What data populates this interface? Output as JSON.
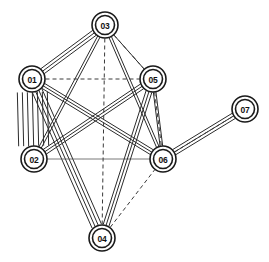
{
  "figure": {
    "type": "network-graph",
    "title": "",
    "background_color": "#ffffff",
    "node_fill_color": "#ffffff",
    "node_stroke_color": "#1a1a1a",
    "edge_color": "#2b2b2b",
    "width": 269,
    "height": 262
  },
  "nodes": [
    {
      "id": "01",
      "label": "01",
      "x": 32,
      "y": 79,
      "r_outer": 13,
      "r_inner": 9.5
    },
    {
      "id": "02",
      "label": "02",
      "x": 34,
      "y": 159,
      "r_outer": 13,
      "r_inner": 9.5
    },
    {
      "id": "03",
      "label": "03",
      "x": 105,
      "y": 25,
      "r_outer": 13,
      "r_inner": 9.5
    },
    {
      "id": "04",
      "label": "04",
      "x": 102,
      "y": 238,
      "r_outer": 13,
      "r_inner": 9.5
    },
    {
      "id": "05",
      "label": "05",
      "x": 153,
      "y": 79,
      "r_outer": 13,
      "r_inner": 9.5
    },
    {
      "id": "06",
      "label": "06",
      "x": 163,
      "y": 159,
      "r_outer": 13,
      "r_inner": 9.5
    },
    {
      "id": "07",
      "label": "07",
      "x": 245,
      "y": 109,
      "r_outer": 13,
      "r_inner": 9.5
    }
  ],
  "edges": [
    {
      "from": "01",
      "to": "02",
      "style": "solid",
      "multiplicity": 7,
      "spread": 5.0
    },
    {
      "from": "01",
      "to": "03",
      "style": "solid",
      "multiplicity": 3,
      "spread": 3.0
    },
    {
      "from": "01",
      "to": "04",
      "style": "solid",
      "multiplicity": 4,
      "spread": 3.4
    },
    {
      "from": "01",
      "to": "05",
      "style": "dashed",
      "multiplicity": 1,
      "spread": 0
    },
    {
      "from": "01",
      "to": "06",
      "style": "solid",
      "multiplicity": 3,
      "spread": 2.8
    },
    {
      "from": "02",
      "to": "03",
      "style": "solid",
      "multiplicity": 2,
      "spread": 2.6
    },
    {
      "from": "02",
      "to": "05",
      "style": "solid",
      "multiplicity": 3,
      "spread": 2.8
    },
    {
      "from": "02",
      "to": "06",
      "style": "thin",
      "multiplicity": 1,
      "spread": 0
    },
    {
      "from": "03",
      "to": "04",
      "style": "dashed",
      "multiplicity": 1,
      "spread": 0
    },
    {
      "from": "03",
      "to": "05",
      "style": "solid",
      "multiplicity": 1,
      "spread": 0
    },
    {
      "from": "03",
      "to": "05",
      "style": "dashed",
      "multiplicity": 1,
      "spread": 3.2
    },
    {
      "from": "03",
      "to": "06",
      "style": "solid",
      "multiplicity": 2,
      "spread": 2.6
    },
    {
      "from": "04",
      "to": "05",
      "style": "solid",
      "multiplicity": 3,
      "spread": 3.0
    },
    {
      "from": "04",
      "to": "06",
      "style": "dashed",
      "multiplicity": 1,
      "spread": 0
    },
    {
      "from": "05",
      "to": "06",
      "style": "solid",
      "multiplicity": 2,
      "spread": 2.6
    },
    {
      "from": "05",
      "to": "06",
      "style": "dashed",
      "multiplicity": 1,
      "spread": 4.0
    },
    {
      "from": "06",
      "to": "07",
      "style": "solid",
      "multiplicity": 3,
      "spread": 3.0
    },
    {
      "from": "06",
      "to": "07",
      "style": "dashed",
      "multiplicity": 1,
      "spread": 5.0
    }
  ]
}
